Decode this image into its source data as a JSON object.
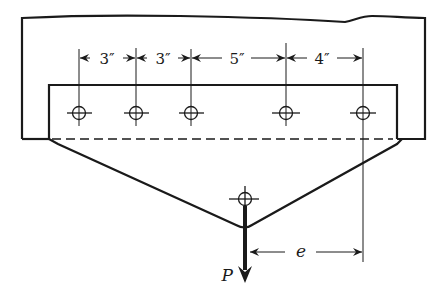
{
  "diagram": {
    "type": "eccentric-bolted-bracket",
    "colors": {
      "ink": "#1a1a1a",
      "background": "#ffffff"
    },
    "bolts": [
      {
        "id": "b1",
        "x": 79
      },
      {
        "id": "b2",
        "x": 136
      },
      {
        "id": "b3",
        "x": 191
      },
      {
        "id": "b4",
        "x": 286
      },
      {
        "id": "b5",
        "x": 363
      }
    ],
    "spacings": [
      {
        "label": "3″",
        "from": "b1",
        "to": "b2"
      },
      {
        "label": "3″",
        "from": "b2",
        "to": "b3"
      },
      {
        "label": "5″",
        "from": "b3",
        "to": "b4"
      },
      {
        "label": "4″",
        "from": "b4",
        "to": "b5"
      }
    ],
    "load": {
      "label": "P",
      "direction": "down"
    },
    "eccentricity": {
      "label": "e"
    }
  }
}
